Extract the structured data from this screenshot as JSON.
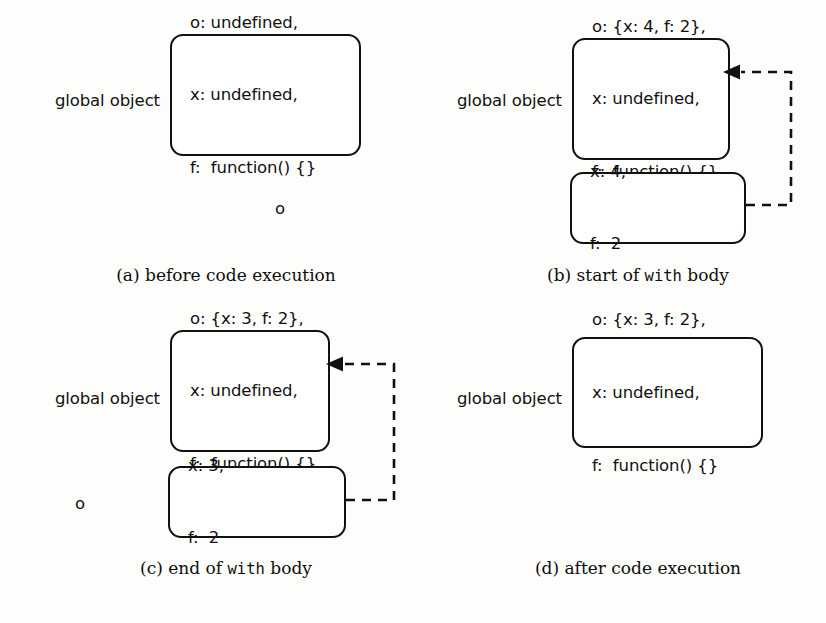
{
  "figure": {
    "background_color": "#fdfdfc",
    "stroke_color": "#111111",
    "text_color": "#101010"
  },
  "panels": [
    {
      "id": "a",
      "caption_prefix": "(a) before code execution",
      "caption_plain_1": "(a) before code execution",
      "caption_mono": "",
      "caption_plain_2": "",
      "global_label": "global object",
      "object_label": "",
      "global_props": [
        "o: undefined,",
        "x: undefined,",
        "f:  function() {}"
      ],
      "object_props": [],
      "has_arrow": false
    },
    {
      "id": "b",
      "caption_prefix": "(b) start of with body",
      "caption_plain_1": "(b) start of ",
      "caption_mono": "with",
      "caption_plain_2": " body",
      "global_label": "global object",
      "object_label": "o",
      "global_props": [
        "o: {x: 4, f: 2},",
        "x: undefined,",
        "f:  function() {}"
      ],
      "object_props": [
        "x: 4,",
        "f:  2"
      ],
      "has_arrow": true
    },
    {
      "id": "c",
      "caption_prefix": "(c) end of with body",
      "caption_plain_1": "(c) end of ",
      "caption_mono": "with",
      "caption_plain_2": " body",
      "global_label": "global object",
      "object_label": "o",
      "global_props": [
        "o: {x: 3, f: 2},",
        "x: undefined,",
        "f:  function() {}"
      ],
      "object_props": [
        "x: 3,",
        "f:  2"
      ],
      "has_arrow": true
    },
    {
      "id": "d",
      "caption_prefix": "(d) after code execution",
      "caption_plain_1": "(d) after code execution",
      "caption_mono": "",
      "caption_plain_2": "",
      "global_label": "global object",
      "object_label": "",
      "global_props": [
        "o: {x: 3, f: 2},",
        "x: undefined,",
        "f:  function() {}"
      ],
      "object_props": [],
      "has_arrow": false
    }
  ]
}
